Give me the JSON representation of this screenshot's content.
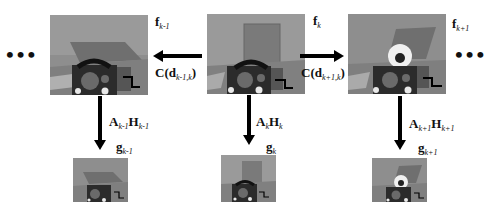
{
  "diagram": {
    "ellipsis_left": "•••",
    "ellipsis_right": "•••",
    "frames": [
      {
        "id": "f_k-1",
        "label_main": "f",
        "label_sub": "k-1",
        "content": "shifted-scene-with-tilted-panel"
      },
      {
        "id": "f_k",
        "label_main": "f",
        "label_sub": "k",
        "content": "scene-with-upright-panel"
      },
      {
        "id": "f_k+1",
        "label_main": "f",
        "label_sub": "k+1",
        "content": "scene-with-tilted-panel-and-white-disc"
      }
    ],
    "horizontal_arrows": [
      {
        "direction": "left",
        "from": "f_k",
        "to": "f_k-1",
        "label_prefix": "C(d",
        "label_sub": "k-1,k",
        "label_suffix": ")"
      },
      {
        "direction": "right",
        "from": "f_k",
        "to": "f_k+1",
        "label_prefix": "C(d",
        "label_sub": "k+1,k",
        "label_suffix": ")"
      }
    ],
    "vertical_arrows": [
      {
        "from": "f_k-1",
        "to": "g_k-1",
        "A": "A",
        "A_sub": "k-1",
        "H": "H",
        "H_sub": "k-1"
      },
      {
        "from": "f_k",
        "to": "g_k",
        "A": "A",
        "A_sub": "k",
        "H": "H",
        "H_sub": "k"
      },
      {
        "from": "f_k+1",
        "to": "g_k+1",
        "A": "A",
        "A_sub": "k+1",
        "H": "H",
        "H_sub": "k+1"
      }
    ],
    "observations": [
      {
        "id": "g_k-1",
        "label_main": "g",
        "label_sub": "k-1"
      },
      {
        "id": "g_k",
        "label_main": "g",
        "label_sub": "k"
      },
      {
        "id": "g_k+1",
        "label_main": "g",
        "label_sub": "k+1"
      }
    ]
  }
}
